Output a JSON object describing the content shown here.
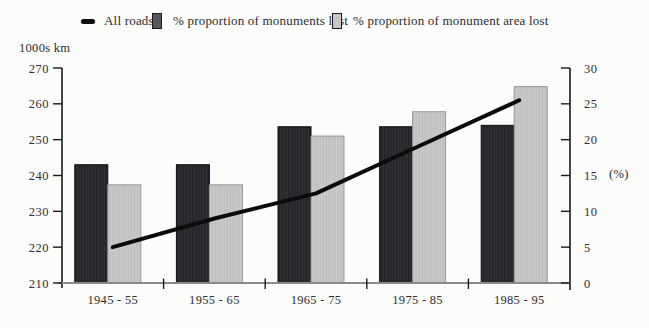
{
  "legend": {
    "items": [
      {
        "label": "All roads",
        "swatch": "line-dash"
      },
      {
        "label": "% proportion of monuments lost",
        "swatch": "dark-bar"
      },
      {
        "label": "% proportion of monument area lost",
        "swatch": "light-bar"
      }
    ]
  },
  "axes": {
    "left_title": "1000s km",
    "right_unit": "(%)"
  },
  "colors": {
    "bar_dark": "#242428",
    "bar_dark_stripe": "#35353b",
    "bar_dark_edge": "#0a0a0a",
    "bar_light": "#c9c9c9",
    "bar_light_stripe": "#bcbcbc",
    "bar_light_edge": "#979797",
    "line": "#0b0b0b",
    "axis": "#1a1a1a",
    "baseline": "#8a8a8a",
    "tick_text": "#2f2f2f"
  },
  "chart_data": {
    "type": "combo-bar-line",
    "categories": [
      "1945 - 55",
      "1955 - 65",
      "1965 - 75",
      "1975 - 85",
      "1985 - 95"
    ],
    "series": [
      {
        "name": "All roads",
        "type": "line",
        "axis": "left",
        "values": [
          220,
          228,
          235,
          248,
          261
        ]
      },
      {
        "name": "% proportion of monuments lost",
        "type": "bar",
        "axis": "right",
        "values": [
          16.5,
          16.5,
          21.8,
          21.8,
          22
        ]
      },
      {
        "name": "% proportion of monument area lost",
        "type": "bar",
        "axis": "right",
        "values": [
          13.7,
          13.7,
          20.5,
          23.9,
          27.4
        ]
      }
    ],
    "left_axis": {
      "title": "1000s km",
      "min": 210,
      "max": 270,
      "step": 10,
      "ticks": [
        270,
        260,
        250,
        240,
        230,
        220,
        210
      ]
    },
    "right_axis": {
      "title": "(%)",
      "min": 0,
      "max": 30,
      "step": 5,
      "ticks": [
        30,
        25,
        20,
        15,
        10,
        5,
        0
      ]
    },
    "grid": false,
    "legend_position": "top"
  }
}
